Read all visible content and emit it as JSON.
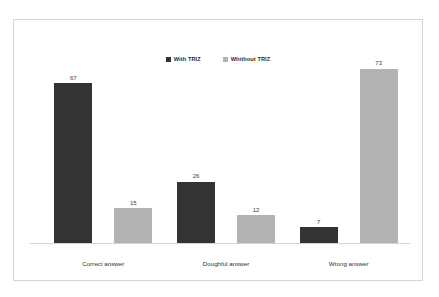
{
  "chart_data": {
    "type": "bar",
    "title": "",
    "subtitle": "",
    "xlabel": "",
    "ylabel": "",
    "categories": [
      "Correct answer",
      "Doughful answer",
      "Wrong answer"
    ],
    "series": [
      {
        "name": "With TRIZ",
        "color": "#333333",
        "values": [
          67,
          26,
          7
        ]
      },
      {
        "name": "Whithout TRIZ",
        "color": "#b3b3b3",
        "values": [
          15,
          12,
          73
        ]
      }
    ],
    "ylim": [
      0,
      80
    ],
    "grid": false,
    "y_axis_visible": false,
    "legend_position": "top-center",
    "data_labels_shown": true
  },
  "legend": {
    "items": [
      {
        "label": "With TRIZ",
        "color": "#333333"
      },
      {
        "label": "Whithout TRIZ",
        "color": "#b3b3b3"
      }
    ]
  },
  "labels": {
    "g0s0": "67",
    "g0s1": "15",
    "g1s0": "26",
    "g1s1": "12",
    "g2s0": "7",
    "g2s1": "73"
  },
  "categories": {
    "c0": "Correct answer",
    "c1": "Doughful answer",
    "c2": "Wrong answer"
  }
}
